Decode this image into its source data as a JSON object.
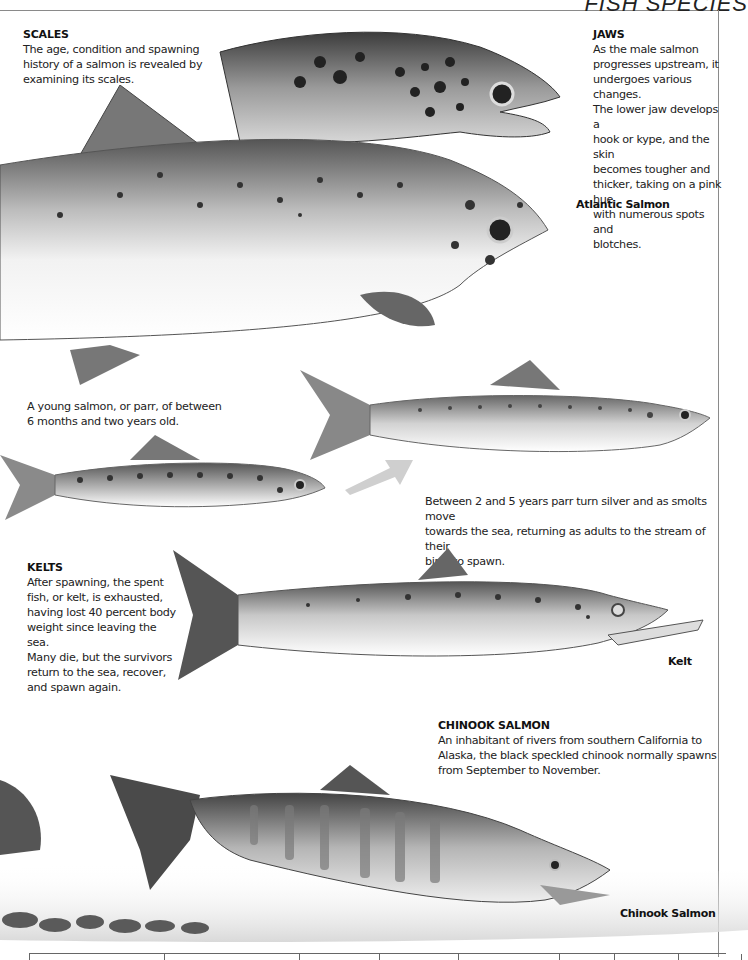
{
  "page": {
    "header_title": "FISH SPECIES"
  },
  "captions": {
    "scales": {
      "heading": "SCALES",
      "lines": [
        "The age, condition and spawning",
        "history of a salmon is revealed by",
        "examining its scales."
      ]
    },
    "jaws": {
      "heading": "JAWS",
      "lines": [
        "As the male salmon",
        "progresses upstream, it",
        "undergoes various changes.",
        "The lower jaw develops a",
        "hook or kype, and the skin",
        "becomes tougher and",
        "thicker, taking on a pink hue",
        "with numerous spots and",
        "blotches."
      ]
    },
    "parr": {
      "lines": [
        "A young salmon, or parr, of between",
        "6 months and two years old."
      ]
    },
    "smolt": {
      "lines": [
        "Between 2 and 5 years parr turn silver and as smolts move",
        "towards the sea, returning as adults to the stream of their",
        "birth to spawn."
      ]
    },
    "kelts": {
      "heading": "KELTS",
      "lines": [
        "After spawning, the spent",
        "fish, or kelt, is exhausted,",
        "having lost 40 percent body",
        "weight since leaving the sea.",
        "Many die, but the survivors",
        "return to the sea, recover,",
        "and spawn again."
      ]
    },
    "chinook": {
      "heading": "CHINOOK SALMON",
      "lines": [
        "An inhabitant of rivers from southern California to",
        "Alaska, the black speckled chinook normally spawns",
        "from September to November."
      ]
    }
  },
  "labels": {
    "atlantic": "Atlantic Salmon",
    "kelt": "Kelt",
    "chinook": "Chinook Salmon"
  },
  "colors": {
    "ink": "#1a1a1a",
    "rule": "#8a8a8a",
    "fish_dark": "#3a3a3a",
    "fish_mid": "#8c8c8c",
    "fish_light": "#e6e6e6"
  }
}
